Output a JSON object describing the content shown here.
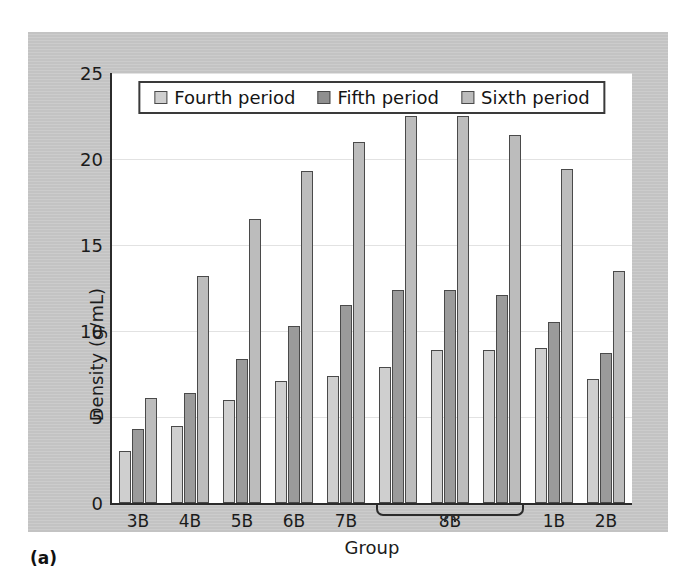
{
  "figure": {
    "caption": "(a)"
  },
  "chart_data": {
    "type": "bar",
    "title": "",
    "xlabel": "Group",
    "ylabel": "Density (g/mL)",
    "ylim": [
      0,
      25
    ],
    "yticks": [
      0,
      5,
      10,
      15,
      20,
      25
    ],
    "ytick_labels": [
      "0",
      "5",
      "10",
      "15",
      "20",
      "25"
    ],
    "grid": true,
    "legend_position": "top-center",
    "legend": [
      "Fourth period",
      "Fifth period",
      "Sixth period"
    ],
    "categories": [
      "3B",
      "4B",
      "5B",
      "6B",
      "7B",
      "8B",
      "8B",
      "8B",
      "1B",
      "2B"
    ],
    "tick_labels": [
      "3B",
      "4B",
      "5B",
      "6B",
      "7B",
      "",
      "8B",
      "",
      "1B",
      "2B"
    ],
    "grouped_label": {
      "label": "8B",
      "spans_columns": [
        5,
        6,
        7
      ]
    },
    "series": [
      {
        "name": "Fourth period",
        "color": "#cfcfcf",
        "values": [
          3.0,
          4.5,
          6.0,
          7.1,
          7.4,
          7.9,
          8.9,
          8.9,
          9.0,
          7.2
        ]
      },
      {
        "name": "Fifth period",
        "color": "#9b9b9b",
        "values": [
          4.3,
          6.4,
          8.4,
          10.3,
          11.5,
          12.4,
          12.4,
          12.1,
          10.5,
          8.7
        ]
      },
      {
        "name": "Sixth period",
        "color": "#bcbcbc",
        "values": [
          6.1,
          13.2,
          16.5,
          19.3,
          21.0,
          22.5,
          22.5,
          21.4,
          19.4,
          13.5
        ]
      }
    ]
  }
}
